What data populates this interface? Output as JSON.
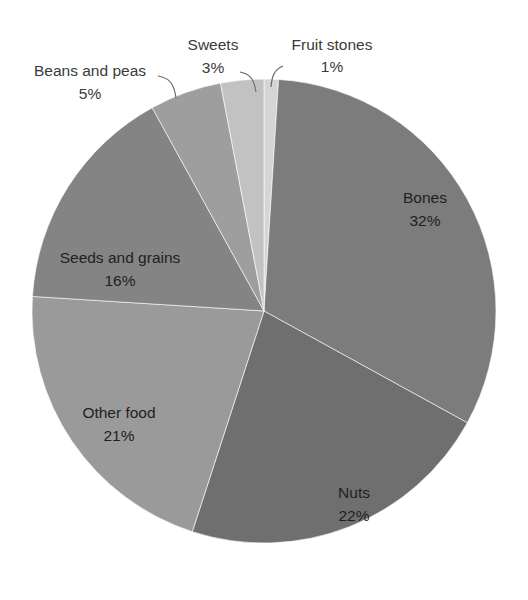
{
  "chart_data": {
    "type": "pie",
    "title": "",
    "subtitle": "",
    "xlabel": "",
    "ylabel": "",
    "legend_position": "none",
    "grid": false,
    "unit": "%",
    "start_angle_deg": 0,
    "direction": "clockwise",
    "categories": [
      "Fruit stones",
      "Bones",
      "Nuts",
      "Other food",
      "Seeds and grains",
      "Beans and peas",
      "Sweets"
    ],
    "values": [
      1,
      32,
      22,
      21,
      16,
      5,
      3
    ],
    "total": 100,
    "slices": [
      {
        "name": "Fruit stones",
        "value": 1,
        "percent_label": "1%",
        "color": "#d5d5d5",
        "label_placement": "outside",
        "label_x": 332,
        "label_name_y": 46,
        "label_value_y": 68,
        "leader": true
      },
      {
        "name": "Bones",
        "value": 32,
        "percent_label": "32%",
        "color": "#7c7c7c",
        "label_placement": "inside",
        "label_x": 425,
        "label_name_y": 199,
        "label_value_y": 222,
        "leader": false
      },
      {
        "name": "Nuts",
        "value": 22,
        "percent_label": "22%",
        "color": "#6f6f6f",
        "label_placement": "inside",
        "label_x": 354,
        "label_name_y": 494,
        "label_value_y": 517,
        "leader": false
      },
      {
        "name": "Other food",
        "value": 21,
        "percent_label": "21%",
        "color": "#9a9a9a",
        "label_placement": "inside",
        "label_x": 119,
        "label_name_y": 414,
        "label_value_y": 437,
        "leader": false
      },
      {
        "name": "Seeds and grains",
        "value": 16,
        "percent_label": "16%",
        "color": "#848484",
        "label_placement": "inside",
        "label_x": 120,
        "label_name_y": 259,
        "label_value_y": 282,
        "leader": false
      },
      {
        "name": "Beans and peas",
        "value": 5,
        "percent_label": "5%",
        "color": "#9e9e9e",
        "label_placement": "outside",
        "label_x": 90,
        "label_name_y": 72,
        "label_value_y": 95,
        "leader": true
      },
      {
        "name": "Sweets",
        "value": 3,
        "percent_label": "3%",
        "color": "#c2c2c2",
        "label_placement": "outside",
        "label_x": 213,
        "label_name_y": 46,
        "label_value_y": 69,
        "leader": true
      }
    ],
    "geometry": {
      "center_x": 264,
      "center_y": 311,
      "radius": 232
    },
    "background_color": "#ffffff"
  }
}
